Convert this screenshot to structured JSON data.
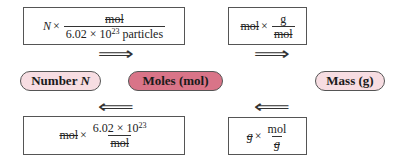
{
  "diagram": {
    "nodes": {
      "number": {
        "label": "Number ",
        "label_var": "N",
        "fill": "#f7dde2"
      },
      "moles": {
        "label": "Moles (mol)",
        "fill": "#d97488"
      },
      "mass": {
        "label": "Mass (g)",
        "fill": "#f7dde2"
      }
    },
    "arrows": {
      "right": "⟹",
      "left": "⟸"
    },
    "conversions": {
      "number_to_moles": {
        "lead_var": "N",
        "times": "×",
        "numerator": "mol",
        "denominator_coeff": "6.02 × 10",
        "denominator_exp": "23",
        "denominator_unit": " particles",
        "direction": "Number → Moles"
      },
      "moles_to_mass": {
        "lead": "mol",
        "times": "×",
        "numerator": "g",
        "denominator": "mol",
        "direction": "Moles → Mass"
      },
      "moles_to_number": {
        "lead": "mol",
        "times": "×",
        "numerator_coeff": "6.02 × 10",
        "numerator_exp": "23",
        "denominator": "mol",
        "direction": "Moles → Number"
      },
      "mass_to_moles": {
        "lead": "g",
        "times": "×",
        "numerator": "mol",
        "denominator": "g",
        "direction": "Mass → Moles"
      }
    },
    "colors": {
      "light_pill": "#f7dde2",
      "dark_pill": "#d97488",
      "border": "#555555"
    }
  }
}
